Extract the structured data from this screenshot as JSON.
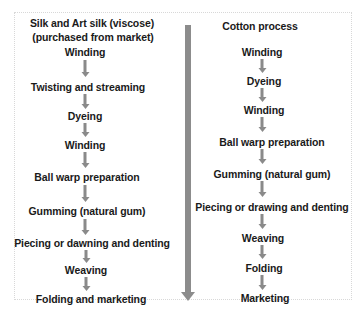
{
  "colors": {
    "arrow": "#8a8a8a",
    "text": "#1a1a1a",
    "border": "#d8d8d8"
  },
  "left_column": {
    "title_line1": "Silk and Art silk (viscose)",
    "title_line2": "(purchased from market)",
    "steps": [
      "Winding",
      "Twisting and streaming",
      "Dyeing",
      "Winding",
      "Ball warp preparation",
      "Gumming (natural gum)",
      "Piecing or dawning and denting",
      "Weaving",
      "Folding and marketing"
    ]
  },
  "right_column": {
    "title": "Cotton process",
    "steps": [
      "Winding",
      "Dyeing",
      "Winding",
      "Ball warp preparation",
      "Gumming (natural gum)",
      "Piecing or drawing and denting",
      "Weaving",
      "Folding",
      "Marketing"
    ]
  },
  "divider": {
    "icon": "down-arrow-icon"
  }
}
